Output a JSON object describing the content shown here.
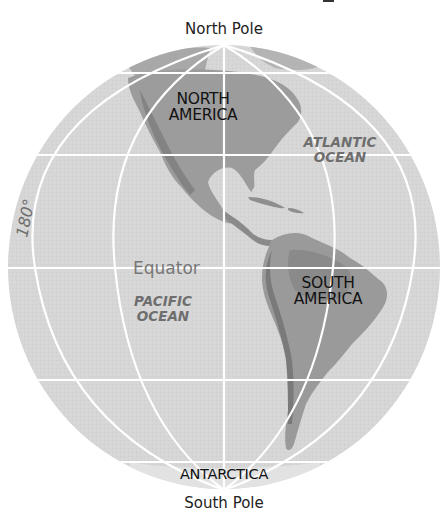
{
  "map": {
    "type": "orthographic globe",
    "colors": {
      "ocean": "#d6d6d6",
      "land": "#9c9c9c",
      "land_dark": "#7e7e7e",
      "gridlines": "#ffffff",
      "label_dark": "#111111",
      "label_ocean": "#6e6e6e"
    },
    "labels": {
      "north_pole": "North Pole",
      "south_pole": "South Pole",
      "north_america_line1": "NORTH",
      "north_america_line2": "AMERICA",
      "south_america_line1": "SOUTH",
      "south_america_line2": "AMERICA",
      "atlantic_line1": "ATLANTIC",
      "atlantic_line2": "OCEAN",
      "pacific_line1": "PACIFIC",
      "pacific_line2": "OCEAN",
      "equator": "Equator",
      "antarctica": "ANTARCTICA",
      "meridian_180": "180°"
    }
  }
}
